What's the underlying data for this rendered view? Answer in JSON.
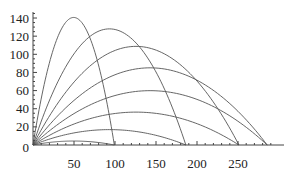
{
  "chart_data": {
    "type": "line",
    "title": "",
    "xlabel": "",
    "ylabel": "",
    "xlim": [
      0,
      290
    ],
    "ylim": [
      0,
      148
    ],
    "grid": false,
    "legend": null,
    "x_ticks": [
      50,
      100,
      150,
      200,
      250
    ],
    "y_ticks": [
      0,
      20,
      40,
      60,
      80,
      100,
      120,
      140
    ],
    "x_tick_labels": [
      "50",
      "100",
      "150",
      "200",
      "250"
    ],
    "y_tick_labels": [
      "0",
      "20",
      "40",
      "60",
      "80",
      "100",
      "120",
      "140"
    ],
    "range_scale": 290,
    "series": [
      {
        "name": "10°",
        "angle_deg": 10,
        "range": 99,
        "peak": [
          50,
          4.4
        ]
      },
      {
        "name": "20°",
        "angle_deg": 20,
        "range": 186,
        "peak": [
          93,
          17
        ]
      },
      {
        "name": "30°",
        "angle_deg": 30,
        "range": 251,
        "peak": [
          126,
          36
        ]
      },
      {
        "name": "40°",
        "angle_deg": 40,
        "range": 286,
        "peak": [
          143,
          60
        ]
      },
      {
        "name": "50°",
        "angle_deg": 50,
        "range": 286,
        "peak": [
          143,
          85
        ]
      },
      {
        "name": "60°",
        "angle_deg": 60,
        "range": 251,
        "peak": [
          126,
          109
        ]
      },
      {
        "name": "70°",
        "angle_deg": 70,
        "range": 186,
        "peak": [
          93,
          128
        ]
      },
      {
        "name": "80°",
        "angle_deg": 80,
        "range": 99,
        "peak": [
          50,
          141
        ]
      }
    ]
  }
}
